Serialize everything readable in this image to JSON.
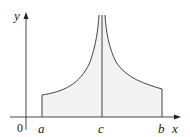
{
  "figure": {
    "axes": {
      "x_label": "x",
      "y_label": "y",
      "origin_label": "0"
    },
    "ticks": {
      "a": "a",
      "c": "c",
      "b": "b"
    },
    "colors": {
      "curve": "#444444",
      "axes": "#333333",
      "fill": "#f3f3f3",
      "background": "#ffffff"
    }
  }
}
